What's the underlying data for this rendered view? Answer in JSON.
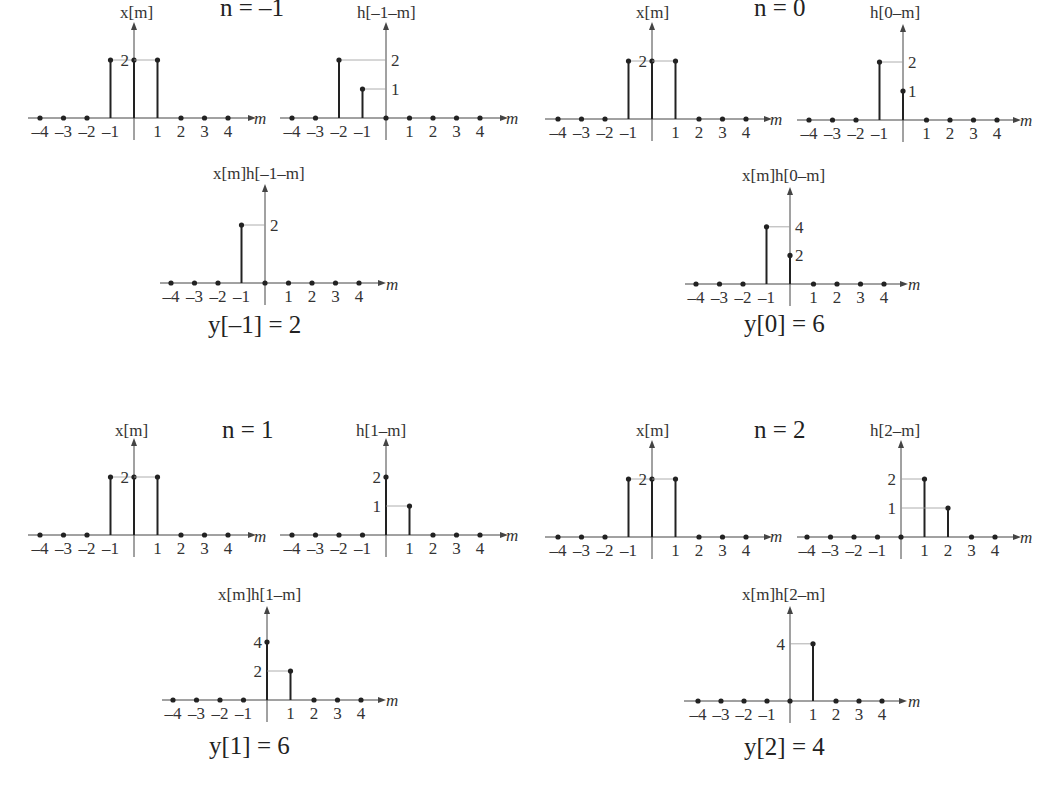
{
  "figure": {
    "tick_labels": [
      "-4",
      "-3",
      "-2",
      "-1",
      "",
      "1",
      "2",
      "3",
      "4"
    ],
    "m_axis_label": "m",
    "panels": [
      {
        "n_label": "n = -1",
        "x_plot": {
          "title": "x[m]",
          "m": [
            -4,
            -3,
            -2,
            -1,
            0,
            1,
            2,
            3,
            4
          ],
          "values": [
            0,
            0,
            0,
            2,
            2,
            2,
            0,
            0,
            0
          ],
          "y_ticks": [
            "2"
          ]
        },
        "h_plot": {
          "title": "h[-1-m]",
          "m": [
            -4,
            -3,
            -2,
            -1,
            0,
            1,
            2,
            3,
            4
          ],
          "values": [
            0,
            0,
            2,
            1,
            0,
            0,
            0,
            0,
            0
          ],
          "y_ticks": [
            "2",
            "1"
          ]
        },
        "product_plot": {
          "title": "x[m]h[-1-m]",
          "m": [
            -4,
            -3,
            -2,
            -1,
            0,
            1,
            2,
            3,
            4
          ],
          "values": [
            0,
            0,
            0,
            2,
            0,
            0,
            0,
            0,
            0
          ],
          "y_ticks": [
            "2"
          ]
        },
        "result": "y[-1] = 2"
      },
      {
        "n_label": "n = 0",
        "x_plot": {
          "title": "x[m]",
          "m": [
            -4,
            -3,
            -2,
            -1,
            0,
            1,
            2,
            3,
            4
          ],
          "values": [
            0,
            0,
            0,
            2,
            2,
            2,
            0,
            0,
            0
          ],
          "y_ticks": [
            "2"
          ]
        },
        "h_plot": {
          "title": "h[0-m]",
          "m": [
            -4,
            -3,
            -2,
            -1,
            0,
            1,
            2,
            3,
            4
          ],
          "values": [
            0,
            0,
            0,
            2,
            1,
            0,
            0,
            0,
            0
          ],
          "y_ticks": [
            "2",
            "1"
          ]
        },
        "product_plot": {
          "title": "x[m]h[0-m]",
          "m": [
            -4,
            -3,
            -2,
            -1,
            0,
            1,
            2,
            3,
            4
          ],
          "values": [
            0,
            0,
            0,
            4,
            2,
            0,
            0,
            0,
            0
          ],
          "y_ticks": [
            "4",
            "2"
          ]
        },
        "result": "y[0] = 6"
      },
      {
        "n_label": "n = 1",
        "x_plot": {
          "title": "x[m]",
          "m": [
            -4,
            -3,
            -2,
            -1,
            0,
            1,
            2,
            3,
            4
          ],
          "values": [
            0,
            0,
            0,
            2,
            2,
            2,
            0,
            0,
            0
          ],
          "y_ticks": [
            "2"
          ]
        },
        "h_plot": {
          "title": "h[1-m]",
          "m": [
            -4,
            -3,
            -2,
            -1,
            0,
            1,
            2,
            3,
            4
          ],
          "values": [
            0,
            0,
            0,
            0,
            2,
            1,
            0,
            0,
            0
          ],
          "y_ticks": [
            "2",
            "1"
          ]
        },
        "product_plot": {
          "title": "x[m]h[1-m]",
          "m": [
            -4,
            -3,
            -2,
            -1,
            0,
            1,
            2,
            3,
            4
          ],
          "values": [
            0,
            0,
            0,
            0,
            4,
            2,
            0,
            0,
            0
          ],
          "y_ticks": [
            "4",
            "2"
          ]
        },
        "result": "y[1] = 6"
      },
      {
        "n_label": "n = 2",
        "x_plot": {
          "title": "x[m]",
          "m": [
            -4,
            -3,
            -2,
            -1,
            0,
            1,
            2,
            3,
            4
          ],
          "values": [
            0,
            0,
            0,
            2,
            2,
            2,
            0,
            0,
            0
          ],
          "y_ticks": [
            "2"
          ]
        },
        "h_plot": {
          "title": "h[2-m]",
          "m": [
            -4,
            -3,
            -2,
            -1,
            0,
            1,
            2,
            3,
            4
          ],
          "values": [
            0,
            0,
            0,
            0,
            0,
            2,
            1,
            0,
            0
          ],
          "y_ticks": [
            "2",
            "1"
          ]
        },
        "product_plot": {
          "title": "x[m]h[2-m]",
          "m": [
            -4,
            -3,
            -2,
            -1,
            0,
            1,
            2,
            3,
            4
          ],
          "values": [
            0,
            0,
            0,
            0,
            0,
            4,
            0,
            0,
            0
          ],
          "y_ticks": [
            "4"
          ]
        },
        "result": "y[2] = 4"
      }
    ]
  }
}
